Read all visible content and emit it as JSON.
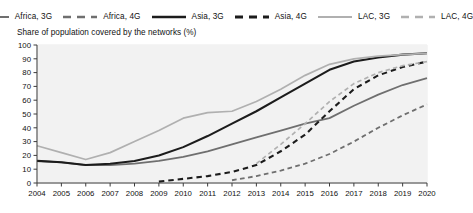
{
  "subtitle": "Share of population covered by the networks (%)",
  "legend": {
    "position": "top-center",
    "entries": [
      {
        "label": "Africa, 3G",
        "color": "#6f6f6f",
        "style": "solid",
        "width": 1.9,
        "name": "legend-africa-3g"
      },
      {
        "label": "Africa, 4G",
        "color": "#6f6f6f",
        "style": "dashed",
        "width": 1.9,
        "name": "legend-africa-4g"
      },
      {
        "label": "Asia, 3G",
        "color": "#1c1c1c",
        "style": "solid",
        "width": 2.2,
        "name": "legend-asia-3g"
      },
      {
        "label": "Asia, 4G",
        "color": "#1c1c1c",
        "style": "dashed",
        "width": 2.2,
        "name": "legend-asia-4g"
      },
      {
        "label": "LAC, 3G",
        "color": "#b0b0b0",
        "style": "solid",
        "width": 1.7,
        "name": "legend-lac-3g"
      },
      {
        "label": "LAC, 4G",
        "color": "#b0b0b0",
        "style": "dashed",
        "width": 1.7,
        "name": "legend-lac-4g"
      }
    ]
  },
  "chart_data": {
    "type": "line",
    "title": "",
    "subtitle": "Share of population covered by the networks (%)",
    "xlabel": "",
    "ylabel": "",
    "ylim": [
      0,
      100
    ],
    "ytick_step": 10,
    "yticks": [
      0,
      10,
      20,
      30,
      40,
      50,
      60,
      70,
      80,
      90,
      100
    ],
    "grid": true,
    "legend_position": "top-center",
    "x": [
      2004,
      2005,
      2006,
      2007,
      2008,
      2009,
      2010,
      2011,
      2012,
      2013,
      2014,
      2015,
      2016,
      2017,
      2018,
      2019,
      2020
    ],
    "categories": [
      "2004",
      "2005",
      "2006",
      "2007",
      "2008",
      "2009",
      "2010",
      "2011",
      "2012",
      "2013",
      "2014",
      "2015",
      "2016",
      "2017",
      "2018",
      "2019",
      "2020"
    ],
    "series": [
      {
        "name": "Africa, 3G",
        "color": "#6f6f6f",
        "style": "solid",
        "values": [
          16,
          15,
          13,
          13,
          14,
          16,
          19,
          23,
          28,
          33,
          38,
          43,
          47,
          56,
          64,
          71,
          76
        ]
      },
      {
        "name": "Africa, 4G",
        "color": "#6f6f6f",
        "style": "dashed",
        "values": [
          null,
          null,
          null,
          null,
          null,
          null,
          null,
          null,
          2,
          5,
          9,
          14,
          21,
          30,
          40,
          49,
          57
        ]
      },
      {
        "name": "Asia, 3G",
        "color": "#1c1c1c",
        "style": "solid",
        "values": [
          16,
          15,
          13,
          14,
          16,
          20,
          26,
          34,
          43,
          52,
          62,
          72,
          82,
          88,
          91,
          93,
          94
        ]
      },
      {
        "name": "Asia, 4G",
        "color": "#1c1c1c",
        "style": "dashed",
        "values": [
          null,
          null,
          null,
          null,
          null,
          1,
          3,
          5,
          8,
          13,
          23,
          35,
          52,
          68,
          78,
          84,
          88
        ]
      },
      {
        "name": "LAC, 3G",
        "color": "#b0b0b0",
        "style": "solid",
        "values": [
          27,
          22,
          17,
          22,
          30,
          38,
          47,
          51,
          52,
          59,
          68,
          78,
          86,
          90,
          92,
          93,
          94
        ]
      },
      {
        "name": "LAC, 4G",
        "color": "#b0b0b0",
        "style": "dashed",
        "values": [
          null,
          null,
          null,
          null,
          null,
          null,
          null,
          null,
          null,
          14,
          28,
          43,
          59,
          72,
          80,
          85,
          88
        ]
      }
    ]
  }
}
